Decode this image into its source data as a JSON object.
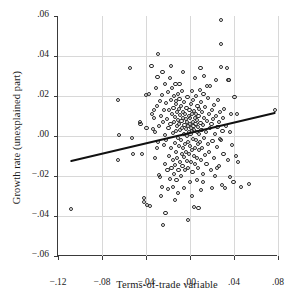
{
  "chart_data": {
    "type": "scatter",
    "title": "",
    "xlabel": "Terms-of-trade variable",
    "ylabel": "Growth rate (unexplained part)",
    "xlim": [
      -0.12,
      0.08
    ],
    "ylim": [
      -0.06,
      0.06
    ],
    "xticks": [
      -0.12,
      -0.08,
      -0.04,
      0.0,
      0.04,
      0.08
    ],
    "xticklabels": [
      "−.12",
      "−.08",
      "−.04",
      ".00",
      ".04",
      ".08"
    ],
    "yticks": [
      -0.06,
      -0.04,
      -0.02,
      0.0,
      0.02,
      0.04,
      0.06
    ],
    "yticklabels": [
      "−.06",
      "−.04",
      "−.02",
      ".00",
      ".02",
      ".04",
      ".06"
    ],
    "grid": true,
    "legend": null,
    "marker": "open-circle",
    "marker_color": "#2b2b2b",
    "fit_line": {
      "type": "line",
      "label": "regression fit",
      "color": "#111111",
      "x_start": -0.108,
      "y_start": -0.0125,
      "x_end": 0.077,
      "y_end": 0.0115,
      "slope": 0.13,
      "intercept": 0.0015
    },
    "points": [
      [
        -0.108,
        -0.0365
      ],
      [
        -0.0655,
        0.0182
      ],
      [
        -0.0655,
        -0.0118
      ],
      [
        -0.0645,
        0.0005
      ],
      [
        -0.0545,
        0.0338
      ],
      [
        -0.053,
        -0.0012
      ],
      [
        -0.052,
        -0.0088
      ],
      [
        -0.0455,
        0.0068
      ],
      [
        -0.045,
        0.0062
      ],
      [
        -0.044,
        -0.009
      ],
      [
        -0.042,
        -0.031
      ],
      [
        -0.0415,
        -0.033
      ],
      [
        -0.04,
        0.0205
      ],
      [
        -0.0395,
        0.004
      ],
      [
        -0.039,
        -0.0345
      ],
      [
        -0.0375,
        0.0212
      ],
      [
        -0.0365,
        -0.035
      ],
      [
        -0.035,
        0.0348
      ],
      [
        -0.0345,
        0.011
      ],
      [
        -0.034,
        0.0035
      ],
      [
        -0.033,
        0.0128
      ],
      [
        -0.0325,
        0.0088
      ],
      [
        -0.032,
        -0.0108
      ],
      [
        -0.0315,
        0.0022
      ],
      [
        -0.031,
        0.0238
      ],
      [
        -0.03,
        0.015
      ],
      [
        -0.0295,
        0.0295
      ],
      [
        -0.029,
        -0.003
      ],
      [
        -0.0285,
        -0.0195
      ],
      [
        -0.028,
        0.0052
      ],
      [
        -0.0275,
        -0.0205
      ],
      [
        -0.027,
        0.0175
      ],
      [
        -0.0265,
        -0.03
      ],
      [
        -0.026,
        0.01
      ],
      [
        -0.0255,
        -0.0255
      ],
      [
        -0.025,
        0.0318
      ],
      [
        -0.0248,
        -0.0445
      ],
      [
        -0.0245,
        0.0068
      ],
      [
        -0.024,
        -0.0045
      ],
      [
        -0.0235,
        0.0132
      ],
      [
        -0.023,
        -0.0142
      ],
      [
        -0.0225,
        0.026
      ],
      [
        -0.0222,
        -0.0385
      ],
      [
        -0.022,
        0.0165
      ],
      [
        -0.0215,
        -0.002
      ],
      [
        -0.021,
        0.0085
      ],
      [
        -0.0205,
        -0.0168
      ],
      [
        -0.02,
        0.0222
      ],
      [
        -0.0198,
        -0.0265
      ],
      [
        -0.0195,
        0.004
      ],
      [
        -0.019,
        0.0128
      ],
      [
        -0.0188,
        -0.0098
      ],
      [
        -0.0185,
        0.029
      ],
      [
        -0.018,
        -0.0215
      ],
      [
        -0.0178,
        0.0058
      ],
      [
        -0.0175,
        0.018
      ],
      [
        -0.017,
        -0.006
      ],
      [
        -0.0168,
        -0.016
      ],
      [
        -0.0165,
        0.0108
      ],
      [
        -0.016,
        0.024
      ],
      [
        -0.0158,
        -0.0118
      ],
      [
        -0.0155,
        0.0015
      ],
      [
        -0.0152,
        -0.0255
      ],
      [
        -0.015,
        0.0142
      ],
      [
        -0.0148,
        0.0072
      ],
      [
        -0.0145,
        -0.0188
      ],
      [
        -0.0142,
        0.02
      ],
      [
        -0.014,
        -0.0035
      ],
      [
        -0.0138,
        0.0095
      ],
      [
        -0.0135,
        -0.0145
      ],
      [
        -0.0132,
        0.0262
      ],
      [
        -0.013,
        0.0025
      ],
      [
        -0.0128,
        -0.0078
      ],
      [
        -0.0125,
        0.0158
      ],
      [
        -0.0122,
        -0.0222
      ],
      [
        -0.012,
        0.0118
      ],
      [
        -0.0118,
        0.0048
      ],
      [
        -0.0115,
        -0.0112
      ],
      [
        -0.0112,
        0.021
      ],
      [
        -0.011,
        -0.0008
      ],
      [
        -0.0108,
        0.0082
      ],
      [
        -0.0105,
        -0.017
      ],
      [
        -0.0102,
        0.0135
      ],
      [
        -0.01,
        0.0062
      ],
      [
        -0.0098,
        -0.0052
      ],
      [
        -0.0095,
        0.0185
      ],
      [
        -0.0092,
        -0.013
      ],
      [
        -0.009,
        0.003
      ],
      [
        -0.0088,
        0.0105
      ],
      [
        -0.0085,
        -0.0198
      ],
      [
        -0.0082,
        0.015
      ],
      [
        -0.008,
        -0.0018
      ],
      [
        -0.0078,
        0.0075
      ],
      [
        -0.0075,
        -0.009
      ],
      [
        -0.0072,
        0.0225
      ],
      [
        -0.007,
        0.0042
      ],
      [
        -0.0068,
        -0.0148
      ],
      [
        -0.0065,
        0.0122
      ],
      [
        -0.0062,
        -0.0062
      ],
      [
        -0.006,
        0.0092
      ],
      [
        -0.0058,
        0.0012
      ],
      [
        -0.0055,
        -0.0105
      ],
      [
        -0.0052,
        0.0168
      ],
      [
        -0.005,
        0.0055
      ],
      [
        -0.0048,
        -0.0042
      ],
      [
        -0.0045,
        0.011
      ],
      [
        -0.0042,
        -0.0172
      ],
      [
        -0.004,
        0.0035
      ],
      [
        -0.0038,
        0.0085
      ],
      [
        -0.0035,
        -0.0078
      ],
      [
        -0.0032,
        0.014
      ],
      [
        -0.003,
        0.0002
      ],
      [
        -0.0028,
        -0.0125
      ],
      [
        -0.0025,
        0.0068
      ],
      [
        -0.0022,
        0.0195
      ],
      [
        -0.002,
        -0.003
      ],
      [
        -0.0018,
        0.0048
      ],
      [
        -0.0015,
        -0.016
      ],
      [
        -0.0012,
        0.0102
      ],
      [
        -0.001,
        0.002
      ],
      [
        -0.0008,
        -0.0088
      ],
      [
        -0.0005,
        0.013
      ],
      [
        -0.0002,
        0.0058
      ],
      [
        0.0,
        -0.0048
      ],
      [
        0.0002,
        0.0088
      ],
      [
        0.0005,
        0.0008
      ],
      [
        0.0008,
        -0.0132
      ],
      [
        0.001,
        0.0158
      ],
      [
        0.0012,
        0.0038
      ],
      [
        0.0015,
        -0.0068
      ],
      [
        0.0018,
        0.0112
      ],
      [
        0.002,
        0.0025
      ],
      [
        0.0022,
        -0.0178
      ],
      [
        0.0025,
        0.0072
      ],
      [
        0.0028,
        0.018
      ],
      [
        0.003,
        -0.0015
      ],
      [
        0.0032,
        0.0052
      ],
      [
        0.0035,
        -0.0102
      ],
      [
        0.0038,
        0.0125
      ],
      [
        0.004,
        0.003
      ],
      [
        0.0042,
        -0.0058
      ],
      [
        0.0045,
        0.0092
      ],
      [
        0.0048,
        -0.0142
      ],
      [
        0.005,
        0.0062
      ],
      [
        0.0052,
        0.0202
      ],
      [
        0.0055,
        -0.0022
      ],
      [
        0.0058,
        0.0108
      ],
      [
        0.006,
        0.0018
      ],
      [
        0.0062,
        -0.0112
      ],
      [
        0.0065,
        0.0078
      ],
      [
        0.0068,
        0.0148
      ],
      [
        0.007,
        -0.0038
      ],
      [
        0.0072,
        0.0045
      ],
      [
        0.0075,
        -0.0162
      ],
      [
        0.0078,
        0.0098
      ],
      [
        0.008,
        0.0008
      ],
      [
        0.0082,
        -0.0072
      ],
      [
        0.0085,
        0.0135
      ],
      [
        0.0088,
        0.0232
      ],
      [
        0.009,
        -0.0028
      ],
      [
        0.0095,
        0.0065
      ],
      [
        0.0098,
        -0.0118
      ],
      [
        0.01,
        0.0172
      ],
      [
        0.0105,
        0.0032
      ],
      [
        0.0108,
        -0.0058
      ],
      [
        0.0112,
        0.0118
      ],
      [
        0.0115,
        -0.0188
      ],
      [
        0.0118,
        0.0055
      ],
      [
        0.0122,
        0.021
      ],
      [
        0.0125,
        -0.0012
      ],
      [
        0.013,
        0.0088
      ],
      [
        0.0135,
        -0.0095
      ],
      [
        0.014,
        0.0145
      ],
      [
        0.0145,
        0.0022
      ],
      [
        0.015,
        -0.0138
      ],
      [
        0.0155,
        0.0075
      ],
      [
        0.016,
        0.0192
      ],
      [
        0.0165,
        -0.0042
      ],
      [
        0.017,
        0.0108
      ],
      [
        0.0175,
        -0.008
      ],
      [
        0.018,
        0.0038
      ],
      [
        0.0185,
        0.0248
      ],
      [
        0.019,
        -0.0168
      ],
      [
        0.0195,
        0.0062
      ],
      [
        0.02,
        0.0128
      ],
      [
        0.0205,
        -0.0025
      ],
      [
        0.021,
        0.0085
      ],
      [
        0.0215,
        -0.0108
      ],
      [
        0.022,
        0.0155
      ],
      [
        0.0225,
        0.0012
      ],
      [
        0.023,
        -0.0202
      ],
      [
        0.0235,
        0.0098
      ],
      [
        0.024,
        0.0278
      ],
      [
        0.0245,
        -0.0055
      ],
      [
        0.025,
        0.0045
      ],
      [
        0.0255,
        0.0182
      ],
      [
        0.026,
        -0.0148
      ],
      [
        0.0265,
        0.0068
      ],
      [
        0.027,
        0.0118
      ],
      [
        0.0275,
        -0.0015
      ],
      [
        0.028,
        0.058
      ],
      [
        0.0282,
        0.0458
      ],
      [
        0.0285,
        0.0345
      ],
      [
        0.029,
        -0.0245
      ],
      [
        0.0295,
        0.0025
      ],
      [
        0.03,
        0.0088
      ],
      [
        0.0305,
        -0.009
      ],
      [
        0.031,
        0.0135
      ],
      [
        0.032,
        -0.0262
      ],
      [
        0.033,
        0.0052
      ],
      [
        0.034,
        0.0338
      ],
      [
        0.0345,
        -0.0122
      ],
      [
        0.035,
        0.0278
      ],
      [
        0.0355,
        0.0282
      ],
      [
        0.036,
        0.0018
      ],
      [
        0.0365,
        -0.0205
      ],
      [
        0.0375,
        0.0112
      ],
      [
        0.0385,
        -0.0045
      ],
      [
        0.0395,
        -0.0228
      ],
      [
        0.0405,
        0.0195
      ],
      [
        0.0415,
        -0.01
      ],
      [
        0.0428,
        0.0112
      ],
      [
        0.044,
        -0.0128
      ],
      [
        0.046,
        -0.0255
      ],
      [
        0.0535,
        -0.0238
      ],
      [
        0.077,
        0.0128
      ],
      [
        -0.029,
        0.0412
      ],
      [
        -0.0255,
        0.0205
      ],
      [
        -0.0175,
        0.0352
      ],
      [
        0.0095,
        0.0342
      ],
      [
        0.0128,
        0.03
      ],
      [
        0.0155,
        0.0252
      ],
      [
        -0.0062,
        0.0318
      ],
      [
        -0.0095,
        0.0262
      ],
      [
        0.0042,
        0.0288
      ],
      [
        0.0015,
        0.0225
      ],
      [
        -0.013,
        0.0175
      ],
      [
        0.0062,
        -0.0218
      ],
      [
        0.0015,
        -0.0298
      ],
      [
        -0.0052,
        -0.0262
      ],
      [
        -0.0108,
        -0.0285
      ],
      [
        0.0035,
        -0.0355
      ],
      [
        -0.0018,
        -0.0422
      ],
      [
        -0.0135,
        -0.0318
      ],
      [
        0.0078,
        -0.0358
      ],
      [
        0.0098,
        -0.0272
      ],
      [
        0.0198,
        -0.0262
      ],
      [
        -0.023,
        0.0005
      ],
      [
        -0.0302,
        -0.0062
      ],
      [
        0.0245,
        -0.0162
      ],
      [
        0.0282,
        -0.0018
      ],
      [
        -0.0002,
        -0.0228
      ],
      [
        0.0118,
        -0.0232
      ]
    ]
  }
}
